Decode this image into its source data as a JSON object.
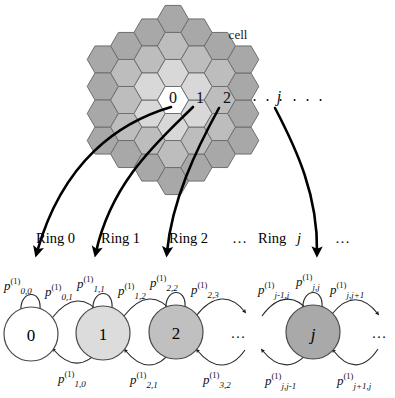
{
  "figure": {
    "cell_label": "cell",
    "ellipsis": "․ ․ ․",
    "dots_short": "…"
  },
  "hex_grid": {
    "ring_labels": [
      "0",
      "1",
      "2",
      "j"
    ],
    "ring_colors": [
      "#ffffff",
      "#d8d8d8",
      "#bdbdbd",
      "#a8a8a8"
    ],
    "hex_stroke": "#6f6f6f",
    "cell_annotation": "cell"
  },
  "ring_arrows": {
    "labels": [
      "Ring 0",
      "Ring 1",
      "Ring 2",
      "Ring j"
    ],
    "gap_dots": "…",
    "trailing_dots": "…",
    "color": "#000000"
  },
  "chain": {
    "nodes": [
      {
        "id": "n0",
        "label": "0",
        "italic": false,
        "fill": "#ffffff"
      },
      {
        "id": "n1",
        "label": "1",
        "italic": false,
        "fill": "#dcdcdc"
      },
      {
        "id": "n2",
        "label": "2",
        "italic": false,
        "fill": "#c0c0c0"
      },
      {
        "id": "nj",
        "label": "j",
        "italic": true,
        "fill": "#a9a9a9"
      }
    ],
    "node_stroke": "#4a4a4a",
    "inter_dots": "…",
    "trailing_dots": "…"
  },
  "probabilities": {
    "self_loops": [
      {
        "base": "p",
        "sup": "(1)",
        "sub": "0,0"
      },
      {
        "base": "p",
        "sup": "(1)",
        "sub": "1,1"
      },
      {
        "base": "p",
        "sup": "(1)",
        "sub": "2,2"
      },
      {
        "base": "p",
        "sup": "(1)",
        "sub": "j,j"
      }
    ],
    "forward": [
      {
        "base": "p",
        "sup": "(1)",
        "sub": "0,1"
      },
      {
        "base": "p",
        "sup": "(1)",
        "sub": "1,2"
      },
      {
        "base": "p",
        "sup": "(1)",
        "sub": "2,3"
      },
      {
        "base": "p",
        "sup": "(1)",
        "sub": "j-1,j"
      },
      {
        "base": "p",
        "sup": "(1)",
        "sub": "j,j+1"
      }
    ],
    "backward": [
      {
        "base": "p",
        "sup": "(1)",
        "sub": "1,0"
      },
      {
        "base": "p",
        "sup": "(1)",
        "sub": "2,1"
      },
      {
        "base": "p",
        "sup": "(1)",
        "sub": "3,2"
      },
      {
        "base": "p",
        "sup": "(1)",
        "sub": "j,j-1"
      },
      {
        "base": "p",
        "sup": "(1)",
        "sub": "j+1,j"
      }
    ]
  }
}
